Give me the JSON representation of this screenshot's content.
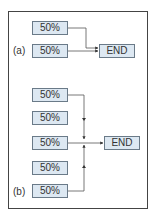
{
  "panel_a": {
    "label": "(a)",
    "inputs": [
      "50%",
      "50%"
    ],
    "output": "END"
  },
  "panel_b": {
    "label": "(b)",
    "inputs": [
      "50%",
      "50%",
      "50%",
      "50%",
      "50%"
    ],
    "output": "END"
  },
  "colors": {
    "box_fill": "#dde8f2",
    "box_border": "#6a7a88",
    "line": "#555555",
    "frame": "#444444"
  }
}
